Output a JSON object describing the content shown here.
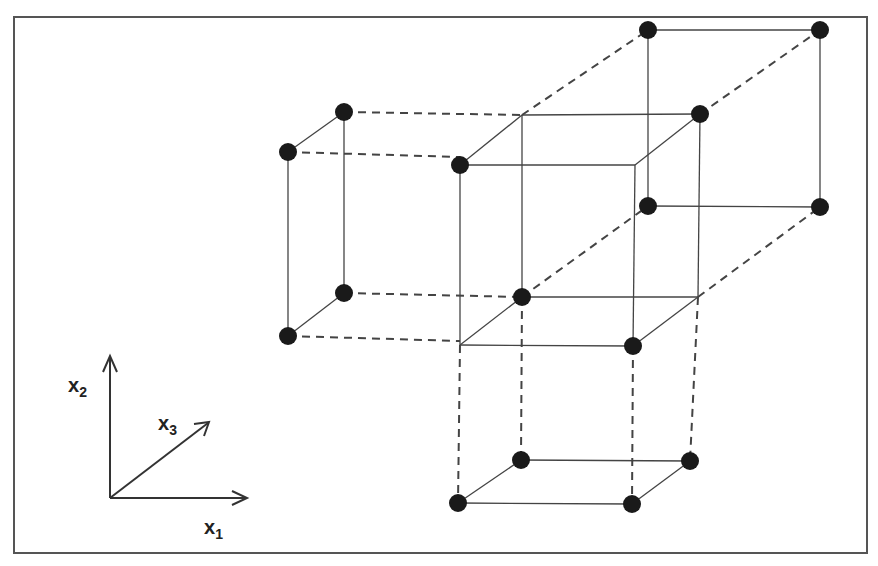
{
  "diagram": {
    "axes": {
      "x1_label": "x",
      "x1_sub": "1",
      "x2_label": "x",
      "x2_sub": "2",
      "x3_label": "x",
      "x3_sub": "3"
    },
    "colors": {
      "line": "#444444",
      "dot": "#1a1a1a",
      "frame": "#555555"
    },
    "points": [
      [
        344,
        112
      ],
      [
        288,
        152
      ],
      [
        344,
        293
      ],
      [
        288,
        336
      ],
      [
        460,
        165
      ],
      [
        522,
        297
      ],
      [
        633,
        346
      ],
      [
        648,
        30
      ],
      [
        820,
        30
      ],
      [
        700,
        114
      ],
      [
        648,
        206
      ],
      [
        820,
        207
      ],
      [
        521,
        460
      ],
      [
        690,
        461
      ],
      [
        458,
        503
      ],
      [
        632,
        504
      ]
    ],
    "solid_lines": [
      [
        288,
        152,
        344,
        112
      ],
      [
        288,
        152,
        288,
        336
      ],
      [
        344,
        112,
        344,
        293
      ],
      [
        288,
        336,
        344,
        293
      ],
      [
        460,
        165,
        635,
        165
      ],
      [
        635,
        165,
        633,
        346
      ],
      [
        460,
        165,
        460,
        345
      ],
      [
        460,
        345,
        633,
        346
      ],
      [
        522,
        115,
        700,
        114
      ],
      [
        522,
        115,
        522,
        297
      ],
      [
        700,
        114,
        698,
        297
      ],
      [
        522,
        297,
        698,
        297
      ],
      [
        460,
        165,
        522,
        115
      ],
      [
        635,
        165,
        700,
        114
      ],
      [
        460,
        345,
        522,
        297
      ],
      [
        633,
        346,
        698,
        297
      ],
      [
        648,
        30,
        820,
        30
      ],
      [
        648,
        30,
        648,
        206
      ],
      [
        820,
        30,
        820,
        207
      ],
      [
        648,
        206,
        820,
        207
      ],
      [
        521,
        460,
        690,
        461
      ],
      [
        458,
        503,
        632,
        504
      ],
      [
        458,
        503,
        521,
        460
      ],
      [
        632,
        504,
        690,
        461
      ]
    ],
    "dashed_lines": [
      [
        344,
        112,
        522,
        115
      ],
      [
        288,
        152,
        460,
        157
      ],
      [
        344,
        293,
        522,
        297
      ],
      [
        288,
        336,
        460,
        341
      ],
      [
        522,
        115,
        648,
        30
      ],
      [
        700,
        114,
        820,
        30
      ],
      [
        522,
        297,
        648,
        206
      ],
      [
        698,
        297,
        820,
        207
      ],
      [
        460,
        345,
        458,
        503
      ],
      [
        633,
        346,
        632,
        504
      ],
      [
        522,
        297,
        521,
        460
      ],
      [
        698,
        297,
        690,
        461
      ]
    ]
  }
}
